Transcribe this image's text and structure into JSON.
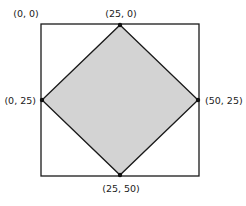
{
  "diagram": {
    "square": {
      "x": 41,
      "y": 24,
      "w": 158,
      "h": 152,
      "stroke": "#1a1a1a",
      "fill": "#ffffff"
    },
    "diamond": {
      "fill": "#d3d3d3",
      "stroke": "#1a1a1a"
    },
    "vertices": {
      "top": {
        "x": 120,
        "y": 25
      },
      "right": {
        "x": 198,
        "y": 100
      },
      "bottom": {
        "x": 120,
        "y": 175
      },
      "left": {
        "x": 42,
        "y": 100
      }
    },
    "labels": {
      "corner_top_left": "(0, 0)",
      "top": "(25, 0)",
      "left": "(0, 25)",
      "right": "(50, 25)",
      "bottom": "(25, 50)"
    }
  }
}
